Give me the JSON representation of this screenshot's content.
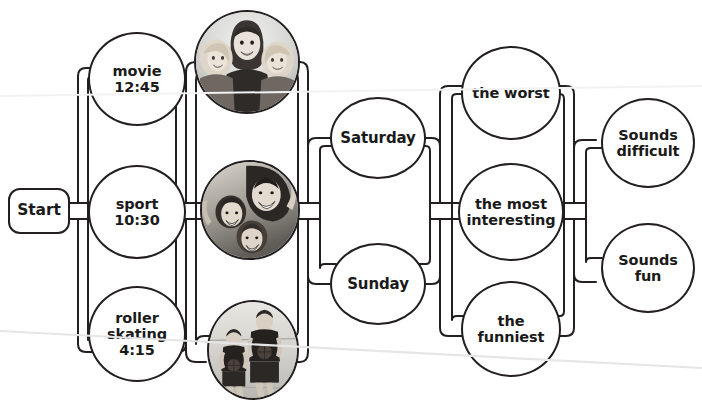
{
  "diagram": {
    "background_color": "#ffffff",
    "line_color": "#231f20",
    "text_color": "#1a1a1a"
  },
  "start": {
    "label": "Start"
  },
  "columns": [
    {
      "name": "activity-options",
      "nodes": [
        {
          "label": "movie\n12:45"
        },
        {
          "label": "sport\n10:30"
        },
        {
          "label": "roller\nskating\n4:15"
        }
      ]
    },
    {
      "name": "photo-options",
      "nodes": [
        {
          "label": "photo-three-girls-smiling"
        },
        {
          "label": "photo-children-laughing"
        },
        {
          "label": "photo-two-basketball-players"
        }
      ]
    },
    {
      "name": "day-options",
      "nodes": [
        {
          "label": "Saturday"
        },
        {
          "label": "Sunday"
        }
      ]
    },
    {
      "name": "superlative-options",
      "nodes": [
        {
          "label": "the worst"
        },
        {
          "label": "the most\ninteresting"
        },
        {
          "label": "the\nfunniest"
        }
      ]
    },
    {
      "name": "reaction-options",
      "nodes": [
        {
          "label": "Sounds\ndifficult"
        },
        {
          "label": "Sounds\nfun"
        }
      ]
    }
  ]
}
